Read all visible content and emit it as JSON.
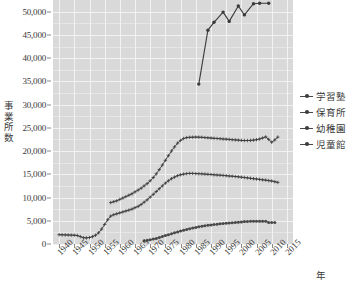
{
  "axes": {
    "y_title": "事業所数",
    "x_title": "年",
    "y_ticks": [
      "0",
      "5,000",
      "10,000",
      "15,000",
      "20,000",
      "25,000",
      "30,000",
      "35,000",
      "40,000",
      "45,000",
      "50,000"
    ],
    "x_ticks": [
      "1940",
      "1945",
      "1950",
      "1955",
      "1960",
      "1965",
      "1970",
      "1975",
      "1980",
      "1985",
      "1990",
      "1995",
      "2000",
      "2005",
      "2010",
      "2015"
    ]
  },
  "legend": {
    "position": "right",
    "items": [
      {
        "label": "学習塾",
        "color": "#3a3a3a"
      },
      {
        "label": "保育所",
        "color": "#3a3a3a"
      },
      {
        "label": "幼稚園",
        "color": "#3a3a3a"
      },
      {
        "label": "児童館",
        "color": "#3a3a3a"
      }
    ]
  },
  "chart_data": {
    "type": "line",
    "title": "",
    "xlabel": "年",
    "ylabel": "事業所数",
    "xlim": [
      1938,
      2017
    ],
    "ylim": [
      0,
      52500
    ],
    "ytick_values": [
      0,
      5000,
      10000,
      15000,
      20000,
      25000,
      30000,
      35000,
      40000,
      45000,
      50000
    ],
    "xtick_values": [
      1940,
      1945,
      1950,
      1955,
      1960,
      1965,
      1970,
      1975,
      1980,
      1985,
      1990,
      1995,
      2000,
      2005,
      2010,
      2015
    ],
    "grid": true,
    "panel_background": "#d9d9d9",
    "grid_color": "#f2f2f2",
    "series": [
      {
        "name": "学習塾",
        "color": "#3a3a3a",
        "marker": "dot",
        "x": [
          1986,
          1989,
          1991,
          1994,
          1996,
          1999,
          2001,
          2004,
          2006,
          2009
        ],
        "values": [
          34400,
          46000,
          47700,
          49900,
          47900,
          51200,
          49300,
          51700,
          51800,
          51800
        ]
      },
      {
        "name": "保育所",
        "color": "#3a3a3a",
        "marker": "plus",
        "x": [
          1957,
          1958,
          1959,
          1960,
          1961,
          1962,
          1963,
          1964,
          1965,
          1966,
          1967,
          1968,
          1969,
          1970,
          1971,
          1972,
          1973,
          1974,
          1975,
          1976,
          1977,
          1978,
          1979,
          1980,
          1981,
          1982,
          1983,
          1984,
          1985,
          1986,
          1987,
          1988,
          1989,
          1990,
          1991,
          1992,
          1993,
          1994,
          1995,
          1996,
          1997,
          1998,
          1999,
          2000,
          2001,
          2002,
          2003,
          2004,
          2005,
          2006,
          2007,
          2008,
          2009,
          2010,
          2011,
          2012
        ],
        "values": [
          8900,
          9100,
          9300,
          9600,
          9900,
          10200,
          10500,
          10800,
          11200,
          11600,
          12000,
          12500,
          13000,
          13600,
          14300,
          15100,
          16000,
          17000,
          18000,
          19000,
          20000,
          20900,
          21700,
          22300,
          22700,
          22900,
          22950,
          22980,
          23000,
          22980,
          22950,
          22900,
          22850,
          22800,
          22750,
          22700,
          22650,
          22600,
          22550,
          22500,
          22450,
          22400,
          22350,
          22300,
          22280,
          22280,
          22300,
          22350,
          22450,
          22600,
          22800,
          23050,
          22500,
          21900,
          22400,
          23000
        ]
      },
      {
        "name": "幼稚園",
        "color": "#3a3a3a",
        "marker": "plus",
        "x": [
          1940,
          1941,
          1942,
          1943,
          1944,
          1945,
          1946,
          1947,
          1948,
          1949,
          1950,
          1951,
          1952,
          1953,
          1954,
          1955,
          1956,
          1957,
          1958,
          1959,
          1960,
          1961,
          1962,
          1963,
          1964,
          1965,
          1966,
          1967,
          1968,
          1969,
          1970,
          1971,
          1972,
          1973,
          1974,
          1975,
          1976,
          1977,
          1978,
          1979,
          1980,
          1981,
          1982,
          1983,
          1984,
          1985,
          1986,
          1987,
          1988,
          1989,
          1990,
          1991,
          1992,
          1993,
          1994,
          1995,
          1996,
          1997,
          1998,
          1999,
          2000,
          2001,
          2002,
          2003,
          2004,
          2005,
          2006,
          2007,
          2008,
          2009,
          2010,
          2011,
          2012
        ],
        "values": [
          2000,
          1980,
          1960,
          1940,
          1920,
          1900,
          1820,
          1600,
          1350,
          1320,
          1400,
          1600,
          1900,
          2400,
          3200,
          4200,
          5200,
          6000,
          6300,
          6500,
          6700,
          6900,
          7100,
          7300,
          7500,
          7800,
          8100,
          8500,
          9000,
          9500,
          10100,
          10700,
          11300,
          11900,
          12500,
          13100,
          13600,
          14050,
          14400,
          14700,
          14900,
          15050,
          15150,
          15200,
          15180,
          15150,
          15120,
          15080,
          15040,
          15000,
          14950,
          14900,
          14850,
          14800,
          14750,
          14700,
          14640,
          14580,
          14520,
          14450,
          14380,
          14300,
          14220,
          14140,
          14060,
          13980,
          13900,
          13820,
          13740,
          13650,
          13550,
          13400,
          13250
        ]
      },
      {
        "name": "児童館",
        "color": "#4a4a4a",
        "marker": "dot",
        "x": [
          1968,
          1969,
          1970,
          1971,
          1972,
          1973,
          1974,
          1975,
          1976,
          1977,
          1978,
          1979,
          1980,
          1981,
          1982,
          1983,
          1984,
          1985,
          1986,
          1987,
          1988,
          1989,
          1990,
          1991,
          1992,
          1993,
          1994,
          1995,
          1996,
          1997,
          1998,
          1999,
          2000,
          2001,
          2002,
          2003,
          2004,
          2005,
          2006,
          2007,
          2008,
          2009,
          2010,
          2011
        ],
        "values": [
          700,
          800,
          900,
          1050,
          1200,
          1400,
          1600,
          1800,
          2000,
          2200,
          2400,
          2600,
          2800,
          2980,
          3150,
          3300,
          3450,
          3580,
          3700,
          3820,
          3930,
          4030,
          4120,
          4200,
          4270,
          4340,
          4400,
          4460,
          4520,
          4580,
          4640,
          4700,
          4760,
          4810,
          4850,
          4880,
          4900,
          4910,
          4915,
          4900,
          4880,
          4620,
          4620,
          4620
        ]
      }
    ]
  }
}
